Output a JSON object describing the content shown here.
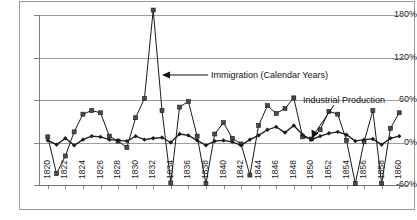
{
  "chart_data": {
    "type": "line",
    "title": "",
    "subtitle": "",
    "xlabel": "",
    "ylabel": "",
    "ylim": [
      -60,
      180
    ],
    "yticks": [
      180,
      120,
      60,
      0,
      -60
    ],
    "ytick_labels": [
      "180%",
      "120%",
      "60%",
      "0%",
      "-60%"
    ],
    "xlim": [
      1819,
      1861
    ],
    "xticks": [
      1820,
      1822,
      1824,
      1826,
      1828,
      1830,
      1832,
      1834,
      1836,
      1838,
      1840,
      1842,
      1844,
      1846,
      1848,
      1850,
      1852,
      1854,
      1856,
      1858,
      1860
    ],
    "xtick_labels": [
      "1820",
      "1822",
      "1824",
      "1826",
      "1828",
      "1830",
      "1832",
      "1834",
      "1836",
      "1838",
      "1840",
      "1842",
      "1844",
      "1846",
      "1848",
      "1850",
      "1852",
      "1854",
      "1856",
      "1858",
      "1860"
    ],
    "grid": true,
    "grid_axis": "y",
    "legend": "none",
    "x": [
      1820,
      1821,
      1822,
      1823,
      1824,
      1825,
      1826,
      1827,
      1828,
      1829,
      1830,
      1831,
      1832,
      1833,
      1834,
      1835,
      1836,
      1837,
      1838,
      1839,
      1840,
      1841,
      1842,
      1843,
      1844,
      1845,
      1846,
      1847,
      1848,
      1849,
      1850,
      1851,
      1852,
      1853,
      1854,
      1855,
      1856,
      1857,
      1858,
      1859,
      1860
    ],
    "series": [
      {
        "name": "Immigration (Calendar Years)",
        "marker": "square",
        "color": "#1a1a1a",
        "values": [
          8,
          -44,
          -19,
          15,
          40,
          45,
          42,
          9,
          2,
          -7,
          35,
          62,
          187,
          45,
          -57,
          50,
          58,
          9,
          -58,
          12,
          28,
          6,
          -2,
          -46,
          24,
          52,
          41,
          48,
          63,
          8,
          5,
          18,
          44,
          40,
          3,
          -58,
          1,
          45,
          -58,
          20,
          42
        ]
      },
      {
        "name": "Industrial Production",
        "marker": "diamond",
        "color": "#1a1a1a",
        "values": [
          3,
          -3,
          6,
          -4,
          4,
          9,
          8,
          4,
          3,
          2,
          9,
          4,
          6,
          7,
          0,
          12,
          10,
          3,
          -4,
          2,
          3,
          1,
          -4,
          4,
          10,
          18,
          22,
          14,
          24,
          11,
          4,
          9,
          13,
          15,
          11,
          2,
          4,
          5,
          -3,
          6,
          9
        ]
      }
    ],
    "annotations": [
      {
        "id": "immigration-annotation",
        "text": "Immigration (Calendar Years)",
        "arrow": "left",
        "points_to_year": 1832
      },
      {
        "id": "industrial-production-annotation",
        "text": "Industrial Production",
        "arrow": "down-left",
        "points_to_year": 1853
      }
    ]
  }
}
